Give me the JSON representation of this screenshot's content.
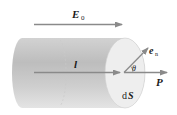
{
  "diagram": {
    "labels": {
      "field": "E",
      "field_sub": "0",
      "length": "l",
      "normal": "e",
      "normal_sub": "n",
      "angle": "θ",
      "polarization": "P",
      "area_d": "d",
      "area": "S"
    },
    "colors": {
      "arrow": "#8a8a8a",
      "cylinder_dark": "#b5b5b5",
      "cylinder_light": "#e6e6e6",
      "end_face": "#eeeeee",
      "text": "#1a1a1a"
    }
  }
}
